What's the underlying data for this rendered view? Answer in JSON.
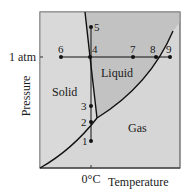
{
  "diagram": {
    "type": "phase-diagram",
    "axes": {
      "ylabel": "Pressure",
      "xlabel": "Temperature",
      "y_tick": "1 atm",
      "x_tick": "0°C"
    },
    "regions": [
      {
        "id": "solid",
        "label": "Solid",
        "color": "#d9d9d9"
      },
      {
        "id": "liquid",
        "label": "Liquid",
        "color": "#c2c2c2"
      },
      {
        "id": "gas",
        "label": "Gas",
        "color": "#d6d6d6"
      }
    ],
    "points": [
      {
        "label": "1"
      },
      {
        "label": "2"
      },
      {
        "label": "3"
      },
      {
        "label": "4"
      },
      {
        "label": "5"
      },
      {
        "label": "6"
      },
      {
        "label": "7"
      },
      {
        "label": "8"
      },
      {
        "label": "9"
      }
    ],
    "colors": {
      "line": "#111111",
      "frame": "#555555"
    }
  }
}
